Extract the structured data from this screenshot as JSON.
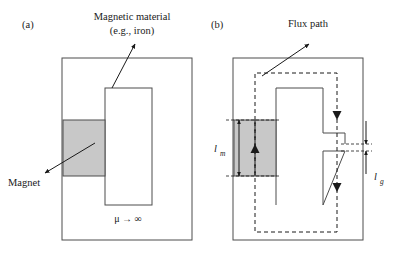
{
  "figure": {
    "width": 406,
    "height": 257,
    "background": "#ffffff",
    "type": "technical-diagram"
  },
  "colors": {
    "magnet_fill": "#c8c8c8",
    "outline": "#4d4d4d",
    "ink": "#1a1a1a",
    "background": "#ffffff"
  },
  "panels": [
    {
      "id": "a",
      "label": "(a)",
      "label_x": 22,
      "label_y": 28,
      "callouts": [
        {
          "name": "magnetic-material",
          "text_line1": "Magnetic material",
          "text_line2": "(e.g., iron)",
          "text_x": 132,
          "text_y1": 20,
          "text_y2": 34,
          "leader_from_x": 112,
          "leader_from_y": 88,
          "leader_to_x": 135,
          "leader_to_y": 44
        },
        {
          "name": "magnet",
          "text_line1": "Magnet",
          "text_line2": "",
          "text_x": 8,
          "text_y1": 186,
          "text_y2": 0,
          "leader_from_x": 95,
          "leader_from_y": 143,
          "leader_to_x": 43,
          "leader_to_y": 172
        }
      ],
      "permeability_note": {
        "text": "μ → ∞",
        "x": 128,
        "y": 222
      }
    },
    {
      "id": "b",
      "label": "(b)",
      "label_x": 211,
      "label_y": 28,
      "callouts": [
        {
          "name": "flux-path",
          "text_line1": "Flux path",
          "text_line2": "",
          "text_x": 308,
          "text_y1": 27,
          "text_y2": 0,
          "leader_from_x": 262,
          "leader_from_y": 76,
          "leader_to_x": 307,
          "leader_to_y": 45
        }
      ],
      "dimensions": [
        {
          "name": "magnet-length",
          "symbol": "l",
          "subscript": "m",
          "label_x": 214,
          "label_y": 152,
          "sub_x": 221,
          "sub_y": 156,
          "line_x": 239,
          "line_y_top": 120,
          "line_y_bottom": 176
        },
        {
          "name": "gap-length",
          "symbol": "l",
          "subscript": "g",
          "label_x": 376,
          "label_y": 177,
          "sub_x": 383,
          "sub_y": 181,
          "line_x": 366,
          "line_y_top": 121,
          "line_y_bottom": 151
        }
      ]
    }
  ],
  "geometry": {
    "panel_a": {
      "outer_rect": {
        "x": 62,
        "y": 58,
        "width": 130,
        "height": 182
      },
      "tooth_rect": {
        "x": 105,
        "y": 88,
        "width": 47,
        "height": 117
      },
      "magnet_rect": {
        "x": 63,
        "y": 120,
        "width": 42,
        "height": 56
      }
    },
    "panel_b": {
      "outer_rect": {
        "x": 233,
        "y": 58,
        "width": 130,
        "height": 182
      },
      "tooth_rect": {
        "x": 276,
        "y": 88,
        "width": 47,
        "height": 117
      },
      "magnet_rect": {
        "x": 234,
        "y": 120,
        "width": 42,
        "height": 56
      },
      "gap_tab_upper": {
        "x": 323,
        "y": 133,
        "width": 22,
        "height": 11
      },
      "gap_tab_lower": {
        "x": 323,
        "y": 151,
        "width": 22,
        "height": 11
      },
      "flux_loop": {
        "left_x": 255,
        "right_x": 337,
        "top_y": 73,
        "bottom_y": 232
      },
      "flux_arrows": [
        {
          "name": "flux-arrow-magnet-up",
          "x": 255,
          "y": 150,
          "direction": "up"
        },
        {
          "name": "flux-arrow-right-upper",
          "x": 337,
          "y": 114,
          "direction": "down"
        },
        {
          "name": "flux-arrow-right-lower",
          "x": 337,
          "y": 186,
          "direction": "down"
        }
      ]
    }
  }
}
